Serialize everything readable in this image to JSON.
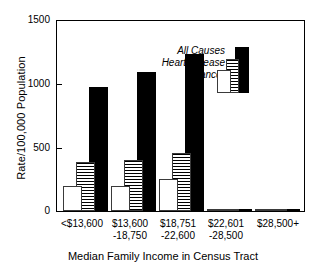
{
  "chart_data": {
    "type": "bar",
    "title": "",
    "xlabel": "Median Family Income in Census Tract",
    "ylabel": "Rate/100,000 Population",
    "ylim": [
      0,
      1500
    ],
    "yticks": [
      0,
      500,
      1000,
      1500
    ],
    "grid": false,
    "legend_position": "upper-center",
    "categories": [
      "<$13,600",
      "$13,600\n-18,750",
      "$18,751\n-22,600",
      "$22,601\n-28,500",
      "$28,500+"
    ],
    "category_lines": [
      [
        "<$13,600",
        ""
      ],
      [
        "$13,600",
        "-18,750"
      ],
      [
        "$18,751",
        "-22,600"
      ],
      [
        "$22,601",
        "-28,500"
      ],
      [
        "$28,500+",
        ""
      ]
    ],
    "series": [
      {
        "name": "Cancer",
        "fill": "white",
        "values": [
          172,
          190,
          192,
          196,
          250
        ]
      },
      {
        "name": "Heart Disease",
        "fill": "hatched",
        "values": [
          305,
          360,
          382,
          395,
          455
        ]
      },
      {
        "name": "All Causes",
        "fill": "black",
        "values": [
          820,
          900,
          965,
          1085,
          1225
        ]
      }
    ]
  },
  "axis": {
    "y_tick_labels": [
      "1500",
      "1000",
      "500",
      "0"
    ],
    "y_title": "Rate/100,000 Population",
    "x_title": "Median Family Income in Census Tract"
  },
  "legend": {
    "items": [
      {
        "label": "All Causes",
        "swatch": "black"
      },
      {
        "label": "Heart Disease",
        "swatch": "hatched"
      },
      {
        "label": "Cancer",
        "swatch": "white"
      }
    ]
  },
  "colors": {
    "all_causes": "#000000",
    "heart_disease_line": "#000000",
    "cancer": "#ffffff",
    "outline": "#3a3a3a",
    "axis": "#000000",
    "background": "#ffffff"
  }
}
